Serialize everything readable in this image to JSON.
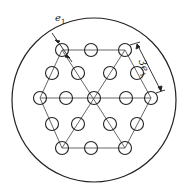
{
  "diagram": {
    "labels": {
      "pitch_label": "e",
      "pitch_sub": "1",
      "span_prefix": "3",
      "span_label": "e",
      "span_sub": "1"
    },
    "colors": {
      "stroke": "#222222",
      "grid": "#555555",
      "background": "#ffffff"
    },
    "outer_circle": {
      "cx": 94,
      "cy": 100,
      "r": 82
    },
    "hole_radius": 6.5,
    "holes": [
      [
        62,
        50
      ],
      [
        91,
        50
      ],
      [
        125,
        50
      ],
      [
        52,
        73
      ],
      [
        78,
        73
      ],
      [
        110,
        73
      ],
      [
        137,
        73
      ],
      [
        40,
        98
      ],
      [
        66,
        98
      ],
      [
        94,
        98
      ],
      [
        126,
        98
      ],
      [
        151,
        98
      ],
      [
        52,
        124
      ],
      [
        78,
        124
      ],
      [
        110,
        124
      ],
      [
        137,
        124
      ],
      [
        62,
        148
      ],
      [
        91,
        148
      ],
      [
        125,
        148
      ]
    ]
  }
}
